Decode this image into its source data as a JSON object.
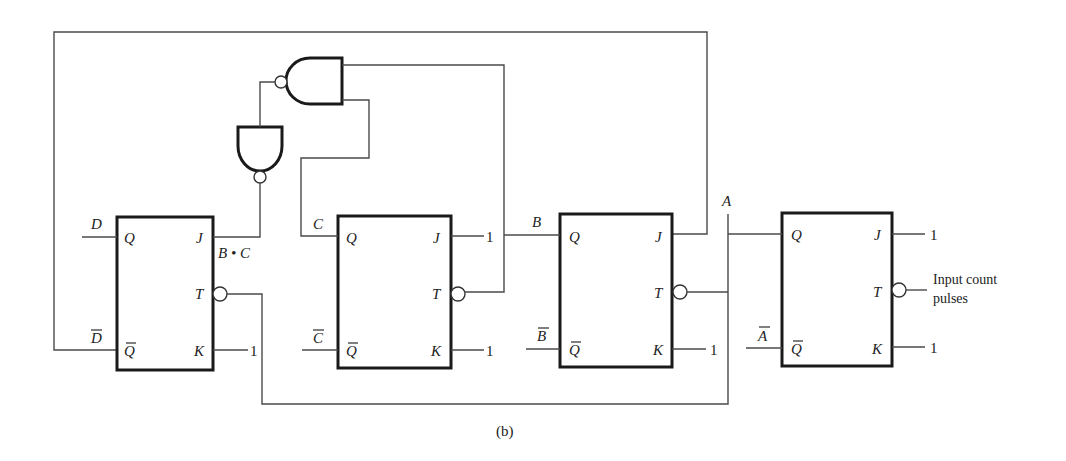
{
  "figure": {
    "caption": "(b)"
  },
  "flip_flops": [
    {
      "id": "FF-D",
      "pins": {
        "Q": "Q",
        "Qbar": "Q",
        "J": "J",
        "T": "T",
        "K": "K"
      },
      "q_signal": "D",
      "qbar_signal": "D",
      "k_value": "1"
    },
    {
      "id": "FF-C",
      "pins": {
        "Q": "Q",
        "Qbar": "Q",
        "J": "J",
        "T": "T",
        "K": "K"
      },
      "q_signal": "C",
      "qbar_signal": "C",
      "j_value": "1",
      "k_value": "1"
    },
    {
      "id": "FF-B",
      "pins": {
        "Q": "Q",
        "Qbar": "Q",
        "J": "J",
        "T": "T",
        "K": "K"
      },
      "q_signal": "B",
      "qbar_signal": "B",
      "k_value": "1"
    },
    {
      "id": "FF-A",
      "pins": {
        "Q": "Q",
        "Qbar": "Q",
        "J": "J",
        "T": "T",
        "K": "K"
      },
      "q_signal": "A",
      "qbar_signal": "A",
      "j_value": "1",
      "k_value": "1"
    }
  ],
  "labels": {
    "b_dot_c": "B • C",
    "input_line1": "Input count",
    "input_line2": "pulses"
  },
  "gates": [
    {
      "id": "nand-top",
      "type": "NAND",
      "inputs": [
        "B",
        "C"
      ]
    },
    {
      "id": "nand-lower",
      "type": "NAND (inverter)",
      "output": "B • C"
    }
  ]
}
